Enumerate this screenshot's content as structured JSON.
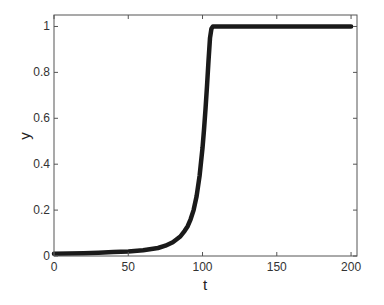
{
  "chart_data": {
    "type": "line",
    "title": "",
    "xlabel": "t",
    "ylabel": "y",
    "xlim": [
      0,
      204
    ],
    "ylim": [
      0,
      1.05
    ],
    "xticks": [
      0,
      50,
      100,
      150,
      200
    ],
    "xtick_labels": [
      "0",
      "50",
      "100",
      "150",
      "200"
    ],
    "yticks": [
      0,
      0.2,
      0.4,
      0.6,
      0.8,
      1
    ],
    "ytick_labels": [
      "0",
      "0.2",
      "0.4",
      "0.6",
      "0.8",
      "1"
    ],
    "grid": false,
    "legend": null,
    "series": [
      {
        "name": "y(t)",
        "color": "#1a1a1a",
        "x": [
          0,
          10,
          20,
          30,
          40,
          50,
          60,
          70,
          75,
          80,
          85,
          88,
          90,
          92,
          94,
          96,
          98,
          100,
          101,
          102,
          103,
          104,
          105,
          106,
          107,
          108,
          110,
          120,
          150,
          200
        ],
        "y": [
          0.01,
          0.011,
          0.012,
          0.014,
          0.017,
          0.02,
          0.025,
          0.035,
          0.045,
          0.06,
          0.085,
          0.11,
          0.13,
          0.16,
          0.2,
          0.26,
          0.35,
          0.47,
          0.55,
          0.64,
          0.74,
          0.85,
          0.95,
          0.99,
          1.0,
          1.0,
          1.0,
          1.0,
          1.0,
          1.0
        ]
      }
    ]
  }
}
